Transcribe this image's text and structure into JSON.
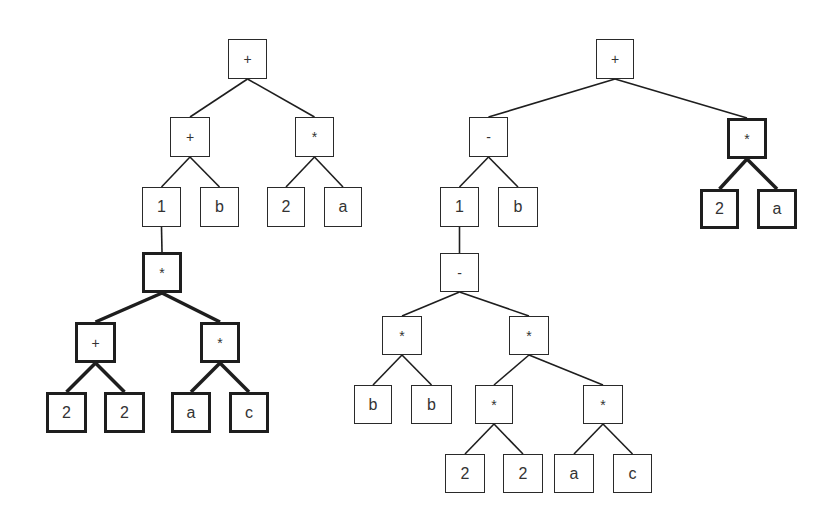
{
  "diagram": {
    "colors": {
      "line": "#1e1e1e",
      "node_border": "#2a2a2a",
      "text": "#333333",
      "background": "#ffffff"
    },
    "trees": [
      {
        "name": "left-tree",
        "nodes": [
          {
            "id": "L1",
            "label": "+",
            "x": 228,
            "y": 39,
            "w": 39,
            "h": 40,
            "bold": false,
            "op": true
          },
          {
            "id": "L2",
            "label": "+",
            "x": 170,
            "y": 117,
            "w": 40,
            "h": 40,
            "bold": false,
            "op": true
          },
          {
            "id": "L3",
            "label": "*",
            "x": 295,
            "y": 117,
            "w": 39,
            "h": 40,
            "bold": false,
            "op": true
          },
          {
            "id": "L4",
            "label": "1",
            "x": 142,
            "y": 187,
            "w": 39,
            "h": 40,
            "bold": false,
            "op": false
          },
          {
            "id": "L5",
            "label": "b",
            "x": 200,
            "y": 187,
            "w": 39,
            "h": 40,
            "bold": false,
            "op": false
          },
          {
            "id": "L6",
            "label": "2",
            "x": 267,
            "y": 187,
            "w": 38,
            "h": 40,
            "bold": false,
            "op": false
          },
          {
            "id": "L7",
            "label": "a",
            "x": 324,
            "y": 187,
            "w": 38,
            "h": 40,
            "bold": false,
            "op": false
          },
          {
            "id": "L8",
            "label": "*",
            "x": 142,
            "y": 252,
            "w": 40,
            "h": 41,
            "bold": true,
            "op": true
          },
          {
            "id": "L9",
            "label": "+",
            "x": 75,
            "y": 322,
            "w": 41,
            "h": 41,
            "bold": true,
            "op": true
          },
          {
            "id": "L10",
            "label": "*",
            "x": 200,
            "y": 322,
            "w": 40,
            "h": 41,
            "bold": true,
            "op": true
          },
          {
            "id": "L11",
            "label": "2",
            "x": 46,
            "y": 392,
            "w": 41,
            "h": 41,
            "bold": true,
            "op": false
          },
          {
            "id": "L12",
            "label": "2",
            "x": 104,
            "y": 392,
            "w": 41,
            "h": 41,
            "bold": true,
            "op": false
          },
          {
            "id": "L13",
            "label": "a",
            "x": 171,
            "y": 392,
            "w": 40,
            "h": 41,
            "bold": true,
            "op": false
          },
          {
            "id": "L14",
            "label": "c",
            "x": 229,
            "y": 392,
            "w": 40,
            "h": 41,
            "bold": true,
            "op": false
          }
        ],
        "edges": [
          {
            "from": "L1",
            "to": "L2",
            "bold": false
          },
          {
            "from": "L1",
            "to": "L3",
            "bold": false
          },
          {
            "from": "L2",
            "to": "L4",
            "bold": false
          },
          {
            "from": "L2",
            "to": "L5",
            "bold": false
          },
          {
            "from": "L3",
            "to": "L6",
            "bold": false
          },
          {
            "from": "L3",
            "to": "L7",
            "bold": false
          },
          {
            "from": "L4",
            "to": "L8",
            "bold": false
          },
          {
            "from": "L8",
            "to": "L9",
            "bold": true
          },
          {
            "from": "L8",
            "to": "L10",
            "bold": true
          },
          {
            "from": "L9",
            "to": "L11",
            "bold": true
          },
          {
            "from": "L9",
            "to": "L12",
            "bold": true
          },
          {
            "from": "L10",
            "to": "L13",
            "bold": true
          },
          {
            "from": "L10",
            "to": "L14",
            "bold": true
          }
        ]
      },
      {
        "name": "right-tree",
        "nodes": [
          {
            "id": "R1",
            "label": "+",
            "x": 596,
            "y": 39,
            "w": 38,
            "h": 40,
            "bold": false,
            "op": true
          },
          {
            "id": "R2",
            "label": "-",
            "x": 469,
            "y": 117,
            "w": 39,
            "h": 40,
            "bold": false,
            "op": true
          },
          {
            "id": "R3",
            "label": "*",
            "x": 727,
            "y": 118,
            "w": 40,
            "h": 41,
            "bold": true,
            "op": true
          },
          {
            "id": "R4",
            "label": "1",
            "x": 440,
            "y": 187,
            "w": 39,
            "h": 40,
            "bold": false,
            "op": false
          },
          {
            "id": "R5",
            "label": "b",
            "x": 498,
            "y": 187,
            "w": 40,
            "h": 40,
            "bold": false,
            "op": false
          },
          {
            "id": "R6",
            "label": "2",
            "x": 700,
            "y": 189,
            "w": 39,
            "h": 40,
            "bold": true,
            "op": false
          },
          {
            "id": "R7",
            "label": "a",
            "x": 757,
            "y": 189,
            "w": 40,
            "h": 40,
            "bold": true,
            "op": false
          },
          {
            "id": "R8",
            "label": "-",
            "x": 440,
            "y": 253,
            "w": 39,
            "h": 39,
            "bold": false,
            "op": true
          },
          {
            "id": "R9",
            "label": "*",
            "x": 382,
            "y": 316,
            "w": 40,
            "h": 39,
            "bold": false,
            "op": true
          },
          {
            "id": "R10",
            "label": "*",
            "x": 509,
            "y": 316,
            "w": 40,
            "h": 39,
            "bold": false,
            "op": true
          },
          {
            "id": "R11",
            "label": "b",
            "x": 354,
            "y": 385,
            "w": 38,
            "h": 39,
            "bold": false,
            "op": false
          },
          {
            "id": "R12",
            "label": "b",
            "x": 411,
            "y": 385,
            "w": 41,
            "h": 39,
            "bold": false,
            "op": false
          },
          {
            "id": "R13",
            "label": "*",
            "x": 475,
            "y": 385,
            "w": 38,
            "h": 39,
            "bold": false,
            "op": true
          },
          {
            "id": "R14",
            "label": "*",
            "x": 583,
            "y": 385,
            "w": 40,
            "h": 39,
            "bold": false,
            "op": true
          },
          {
            "id": "R15",
            "label": "2",
            "x": 445,
            "y": 454,
            "w": 40,
            "h": 39,
            "bold": false,
            "op": false
          },
          {
            "id": "R16",
            "label": "2",
            "x": 503,
            "y": 454,
            "w": 40,
            "h": 39,
            "bold": false,
            "op": false
          },
          {
            "id": "R17",
            "label": "a",
            "x": 554,
            "y": 454,
            "w": 40,
            "h": 39,
            "bold": false,
            "op": false
          },
          {
            "id": "R18",
            "label": "c",
            "x": 613,
            "y": 454,
            "w": 39,
            "h": 39,
            "bold": false,
            "op": false
          }
        ],
        "edges": [
          {
            "from": "R1",
            "to": "R2",
            "bold": false
          },
          {
            "from": "R1",
            "to": "R3",
            "bold": false
          },
          {
            "from": "R2",
            "to": "R4",
            "bold": false
          },
          {
            "from": "R2",
            "to": "R5",
            "bold": false
          },
          {
            "from": "R3",
            "to": "R6",
            "bold": true
          },
          {
            "from": "R3",
            "to": "R7",
            "bold": true
          },
          {
            "from": "R4",
            "to": "R8",
            "bold": false
          },
          {
            "from": "R8",
            "to": "R9",
            "bold": false
          },
          {
            "from": "R8",
            "to": "R10",
            "bold": false
          },
          {
            "from": "R9",
            "to": "R11",
            "bold": false
          },
          {
            "from": "R9",
            "to": "R12",
            "bold": false
          },
          {
            "from": "R10",
            "to": "R13",
            "bold": false
          },
          {
            "from": "R10",
            "to": "R14",
            "bold": false
          },
          {
            "from": "R13",
            "to": "R15",
            "bold": false
          },
          {
            "from": "R13",
            "to": "R16",
            "bold": false
          },
          {
            "from": "R14",
            "to": "R17",
            "bold": false
          },
          {
            "from": "R14",
            "to": "R18",
            "bold": false
          }
        ]
      }
    ]
  }
}
